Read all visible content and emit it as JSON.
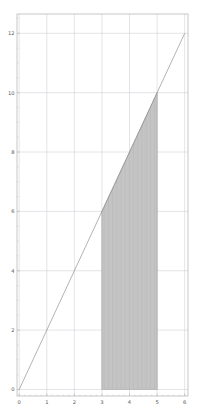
{
  "figure": {
    "background_color": "#ffffff",
    "width": 199,
    "height": 419
  },
  "chart_data": {
    "type": "line",
    "title": "",
    "xlabel": "",
    "ylabel": "",
    "xlim": [
      -0.08,
      6.12
    ],
    "ylim": [
      -0.22,
      12.65
    ],
    "grid": true,
    "legend": null,
    "series": [
      {
        "name": "y = 2x",
        "type": "line",
        "color": "#808080",
        "linewidth": 0.6,
        "x": [
          0,
          1,
          2,
          3,
          4,
          5,
          6
        ],
        "values": [
          0,
          2,
          4,
          6,
          8,
          10,
          12
        ]
      }
    ],
    "shaded_region": {
      "name": "area-under-curve",
      "x_start": 3,
      "x_end": 5,
      "y_at_start": 6,
      "y_at_end": 10,
      "baseline": 0,
      "hatch": "vertical-lines",
      "hatch_count": 42,
      "fill_color": "#d4d4d4",
      "hatch_color": "#909090",
      "edge_color": "#a0a0a0",
      "area": 16
    },
    "x_ticks": [
      0,
      1,
      2,
      3,
      4,
      5,
      6
    ],
    "x_tick_labels": [
      "0",
      "1",
      "2",
      "3",
      "4",
      "5",
      "6"
    ],
    "x_minor_ticks": [
      0.2,
      0.4,
      0.6,
      0.8,
      1.2,
      1.4,
      1.6,
      1.8,
      2.2,
      2.4,
      2.6,
      2.8,
      3.2,
      3.4,
      3.6,
      3.8,
      4.2,
      4.4,
      4.6,
      4.8,
      5.2,
      5.4,
      5.6,
      5.8
    ],
    "y_ticks": [
      0,
      2,
      4,
      6,
      8,
      10,
      12
    ],
    "y_tick_labels": [
      "0",
      "2",
      "4",
      "6",
      "8",
      "10",
      "12"
    ],
    "y_minor_ticks": [
      0.5,
      1.0,
      1.5,
      2.5,
      3.0,
      3.5,
      4.5,
      5.0,
      5.5,
      6.5,
      7.0,
      7.5,
      8.5,
      9.0,
      9.5,
      10.5,
      11.0,
      11.5,
      12.5
    ],
    "grid_color": "#c8c8d0",
    "axis_color": "#b0b0b0",
    "tick_label_color": "#555555"
  }
}
